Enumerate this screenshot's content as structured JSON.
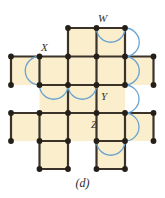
{
  "figure": {
    "caption": "(d)",
    "caption_x": 0,
    "caption_y": 176,
    "width": 165,
    "height": 198,
    "background": "#ffffff",
    "colors": {
      "cell_fill": "#faeecd",
      "edge": "#3b332a",
      "vertex": "#241f19",
      "arc": "#6aa3d0",
      "label_text": "#3a3227",
      "caption_text": "#2b2b2b"
    },
    "style": {
      "edge_width": 2.2,
      "vertex_radius": 2.9,
      "arc_width": 1.3,
      "cell_size_x": 28.5,
      "cell_size_y": 28.2
    },
    "grid": {
      "origin_x": 11,
      "origin_y": 28,
      "columns_x": [
        11,
        39.5,
        68,
        96.5,
        125,
        153.5
      ],
      "rows_y": [
        28,
        56.5,
        85,
        113,
        141,
        169
      ]
    },
    "cells": [
      {
        "name": "cell-c2-r0",
        "col": 2,
        "row": 0
      },
      {
        "name": "cell-c3-r0",
        "col": 3,
        "row": 0
      },
      {
        "name": "cell-c0-r1",
        "col": 0,
        "row": 1
      },
      {
        "name": "cell-c1-r1",
        "col": 1,
        "row": 1
      },
      {
        "name": "cell-c2-r1",
        "col": 2,
        "row": 1
      },
      {
        "name": "cell-c3-r1",
        "col": 3,
        "row": 1
      },
      {
        "name": "cell-c4-r1",
        "col": 4,
        "row": 1
      },
      {
        "name": "cell-c1-r2",
        "col": 1,
        "row": 2
      },
      {
        "name": "cell-c2-r2",
        "col": 2,
        "row": 2
      },
      {
        "name": "cell-c3-r2",
        "col": 3,
        "row": 2
      },
      {
        "name": "cell-c0-r3",
        "col": 0,
        "row": 3
      },
      {
        "name": "cell-c1-r3",
        "col": 1,
        "row": 3
      },
      {
        "name": "cell-c2-r3",
        "col": 2,
        "row": 3
      },
      {
        "name": "cell-c3-r3",
        "col": 3,
        "row": 3
      },
      {
        "name": "cell-c4-r3",
        "col": 4,
        "row": 3
      },
      {
        "name": "cell-c1-r4",
        "col": 1,
        "row": 4
      },
      {
        "name": "cell-c3-r4",
        "col": 3,
        "row": 4
      }
    ],
    "edges_horizontal": [
      {
        "row": 0,
        "col_from": 2,
        "col_to": 4
      },
      {
        "row": 1,
        "col_from": 0,
        "col_to": 5
      },
      {
        "row": 2,
        "col_from": 1,
        "col_to": 4
      },
      {
        "row": 3,
        "col_from": 0,
        "col_to": 5
      },
      {
        "row": 4,
        "col_from": 1,
        "col_to": 2
      },
      {
        "row": 4,
        "col_from": 3,
        "col_to": 4
      },
      {
        "row": 5,
        "col_from": 1,
        "col_to": 2
      },
      {
        "row": 5,
        "col_from": 3,
        "col_to": 4
      }
    ],
    "edges_vertical": [
      {
        "col": 0,
        "row_from": 1,
        "row_to": 2
      },
      {
        "col": 0,
        "row_from": 3,
        "row_to": 4
      },
      {
        "col": 1,
        "row_from": 1,
        "row_to": 2
      },
      {
        "col": 1,
        "row_from": 3,
        "row_to": 5
      },
      {
        "col": 2,
        "row_from": 0,
        "row_to": 5
      },
      {
        "col": 3,
        "row_from": 0,
        "row_to": 5
      },
      {
        "col": 4,
        "row_from": 0,
        "row_to": 2
      },
      {
        "col": 4,
        "row_from": 3,
        "row_to": 5
      },
      {
        "col": 5,
        "row_from": 1,
        "row_to": 2
      },
      {
        "col": 5,
        "row_from": 3,
        "row_to": 4
      }
    ],
    "vertices": [
      {
        "col": 2,
        "row": 0
      },
      {
        "col": 3,
        "row": 0
      },
      {
        "col": 4,
        "row": 0
      },
      {
        "col": 0,
        "row": 1
      },
      {
        "col": 1,
        "row": 1
      },
      {
        "col": 2,
        "row": 1
      },
      {
        "col": 3,
        "row": 1
      },
      {
        "col": 4,
        "row": 1
      },
      {
        "col": 5,
        "row": 1
      },
      {
        "col": 0,
        "row": 2
      },
      {
        "col": 1,
        "row": 2
      },
      {
        "col": 2,
        "row": 2
      },
      {
        "col": 3,
        "row": 2
      },
      {
        "col": 4,
        "row": 2
      },
      {
        "col": 5,
        "row": 2
      },
      {
        "col": 0,
        "row": 3
      },
      {
        "col": 1,
        "row": 3
      },
      {
        "col": 2,
        "row": 3
      },
      {
        "col": 3,
        "row": 3
      },
      {
        "col": 4,
        "row": 3
      },
      {
        "col": 5,
        "row": 3
      },
      {
        "col": 0,
        "row": 4
      },
      {
        "col": 1,
        "row": 4
      },
      {
        "col": 2,
        "row": 4
      },
      {
        "col": 3,
        "row": 4
      },
      {
        "col": 4,
        "row": 4
      },
      {
        "col": 5,
        "row": 4
      },
      {
        "col": 1,
        "row": 5
      },
      {
        "col": 2,
        "row": 5
      },
      {
        "col": 3,
        "row": 5
      },
      {
        "col": 4,
        "row": 5
      }
    ],
    "arcs": [
      {
        "name": "arc-w-top",
        "from_col": 3,
        "from_row": 0,
        "to_col": 4,
        "to_row": 0,
        "orientation": "horizontal",
        "bulge": "down"
      },
      {
        "name": "arc-right-upper",
        "from_col": 4,
        "from_row": 0,
        "to_col": 4,
        "to_row": 1,
        "orientation": "vertical",
        "bulge": "right"
      },
      {
        "name": "arc-right-mid",
        "from_col": 4,
        "from_row": 1,
        "to_col": 4,
        "to_row": 2,
        "orientation": "vertical",
        "bulge": "right"
      },
      {
        "name": "arc-right-lower",
        "from_col": 4,
        "from_row": 2,
        "to_col": 4,
        "to_row": 3,
        "orientation": "vertical",
        "bulge": "right"
      },
      {
        "name": "arc-right-bottom",
        "from_col": 4,
        "from_row": 3,
        "to_col": 4,
        "to_row": 4,
        "orientation": "vertical",
        "bulge": "right"
      },
      {
        "name": "arc-x-left",
        "from_col": 1,
        "from_row": 1,
        "to_col": 1,
        "to_row": 2,
        "orientation": "vertical",
        "bulge": "left"
      },
      {
        "name": "arc-y-left",
        "from_col": 1,
        "from_row": 2,
        "to_col": 2,
        "to_row": 2,
        "orientation": "horizontal",
        "bulge": "down"
      },
      {
        "name": "arc-y-right",
        "from_col": 2,
        "from_row": 2,
        "to_col": 3,
        "to_row": 2,
        "orientation": "horizontal",
        "bulge": "down"
      },
      {
        "name": "arc-z-bottom",
        "from_col": 3,
        "from_row": 4,
        "to_col": 4,
        "to_row": 4,
        "orientation": "horizontal",
        "bulge": "down"
      }
    ],
    "labels": [
      {
        "name": "vertex-label-w",
        "text": "W",
        "x": 98,
        "y": 13
      },
      {
        "name": "vertex-label-x",
        "text": "X",
        "x": 41,
        "y": 42
      },
      {
        "name": "vertex-label-y",
        "text": "Y",
        "x": 101,
        "y": 91
      },
      {
        "name": "vertex-label-z",
        "text": "Z",
        "x": 91,
        "y": 119
      }
    ]
  }
}
